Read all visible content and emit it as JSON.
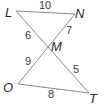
{
  "diagram": {
    "type": "intersecting-segments-triangles",
    "vertices": {
      "L": {
        "label": "L",
        "x": 16,
        "y": 11
      },
      "N": {
        "label": "N",
        "x": 75,
        "y": 14
      },
      "M": {
        "label": "M",
        "x": 47,
        "y": 46
      },
      "O": {
        "label": "O",
        "x": 18,
        "y": 84
      },
      "T": {
        "label": "T",
        "x": 89,
        "y": 93
      }
    },
    "segments": [
      {
        "from": "L",
        "to": "N",
        "length_label": "10"
      },
      {
        "from": "N",
        "to": "M",
        "length_label": "7"
      },
      {
        "from": "L",
        "to": "M",
        "length_label": "6"
      },
      {
        "from": "O",
        "to": "M",
        "length_label": "9"
      },
      {
        "from": "M",
        "to": "T",
        "length_label": "5"
      },
      {
        "from": "O",
        "to": "T",
        "length_label": "8"
      }
    ],
    "labels": {
      "L": "L",
      "N": "N",
      "M": "M",
      "O": "O",
      "T": "T",
      "LN": "10",
      "NM": "7",
      "LM": "6",
      "OM": "9",
      "MT": "5",
      "OT": "8"
    },
    "colors": {
      "line": "#8a8a8a",
      "text": "#2a2a2a",
      "background": "#ffffff"
    }
  }
}
